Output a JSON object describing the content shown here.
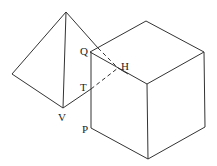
{
  "diagram": {
    "colors": {
      "line": "#333333",
      "background": "#ffffff"
    },
    "labels": [
      {
        "id": "Q",
        "text": "Q",
        "x": 80,
        "y": 46
      },
      {
        "id": "H",
        "text": "H",
        "x": 121,
        "y": 61
      },
      {
        "id": "T",
        "text": "T",
        "x": 80,
        "y": 82
      },
      {
        "id": "V",
        "text": "V",
        "x": 58,
        "y": 112
      },
      {
        "id": "P",
        "text": "P",
        "x": 82,
        "y": 124
      }
    ]
  }
}
